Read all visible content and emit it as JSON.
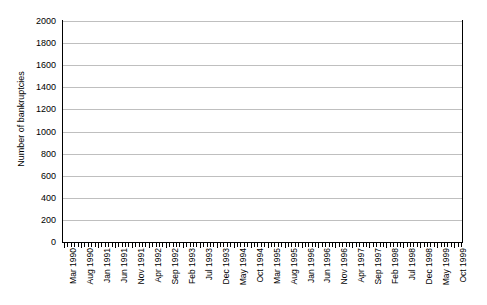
{
  "chart_data": {
    "type": "line",
    "title": "",
    "xlabel": "",
    "ylabel": "Number of bankruptcies",
    "ylim": [
      0,
      2000
    ],
    "ytick_step": 200,
    "yticks": [
      2000,
      1800,
      1600,
      1400,
      1200,
      1000,
      800,
      600,
      400,
      200,
      0
    ],
    "grid": "horizontal",
    "legend": "none",
    "marker": "filled-diamond",
    "line_color": "#000000",
    "grid_color": "#bfbfbf",
    "x_tick_interval_months": 1,
    "x_label_interval_months": 5,
    "x_start": "Mar 1990",
    "x_end": "Dec 1999",
    "xtick_labels": [
      "Mar 1990",
      "Aug 1990",
      "Jan 1991",
      "Jun 1991",
      "Nov 1991",
      "Apr 1992",
      "Sep 1992",
      "Feb 1993",
      "Jul 1993",
      "Dec 1993",
      "May 1994",
      "Oct 1994",
      "Mar 1995",
      "Aug 1995",
      "Jan 1996",
      "Jun 1996",
      "Nov 1996",
      "Apr 1997",
      "Sep 1997",
      "Feb 1998",
      "Jul 1998",
      "Dec 1998",
      "May 1999",
      "Oct 1999"
    ],
    "x": [
      "Mar 1990",
      "Apr 1990",
      "May 1990",
      "Jun 1990",
      "Jul 1990",
      "Aug 1990",
      "Sep 1990",
      "Oct 1990",
      "Nov 1990",
      "Dec 1990",
      "Jan 1991",
      "Feb 1991",
      "Mar 1991",
      "Apr 1991",
      "May 1991",
      "Jun 1991",
      "Jul 1991",
      "Aug 1991",
      "Sep 1991",
      "Oct 1991",
      "Nov 1991",
      "Dec 1991",
      "Jan 1992",
      "Feb 1992",
      "Mar 1992",
      "Apr 1992",
      "May 1992",
      "Jun 1992",
      "Jul 1992",
      "Aug 1992",
      "Sep 1992",
      "Oct 1992",
      "Nov 1992",
      "Dec 1992",
      "Jan 1993",
      "Feb 1993",
      "Mar 1993",
      "Apr 1993",
      "May 1993",
      "Jun 1993",
      "Jul 1993",
      "Aug 1993",
      "Sep 1993",
      "Oct 1993",
      "Nov 1993",
      "Dec 1993",
      "Jan 1994",
      "Feb 1994",
      "Mar 1994",
      "Apr 1994",
      "May 1994",
      "Jun 1994",
      "Jul 1994",
      "Aug 1994",
      "Sep 1994",
      "Oct 1994",
      "Nov 1994",
      "Dec 1994",
      "Jan 1995",
      "Feb 1995",
      "Mar 1995",
      "Apr 1995",
      "May 1995",
      "Jun 1995",
      "Jul 1995",
      "Aug 1995",
      "Sep 1995",
      "Oct 1995",
      "Nov 1995",
      "Dec 1995",
      "Jan 1996",
      "Feb 1996",
      "Mar 1996",
      "Apr 1996",
      "May 1996",
      "Jun 1996",
      "Jul 1996",
      "Aug 1996",
      "Sep 1996",
      "Oct 1996",
      "Nov 1996",
      "Dec 1996",
      "Jan 1997",
      "Feb 1997",
      "Mar 1997",
      "Apr 1997",
      "May 1997",
      "Jun 1997",
      "Jul 1997",
      "Aug 1997",
      "Sep 1997",
      "Oct 1997",
      "Nov 1997",
      "Dec 1997",
      "Jan 1998",
      "Feb 1998",
      "Mar 1998",
      "Apr 1998",
      "May 1998",
      "Jun 1998",
      "Jul 1998",
      "Aug 1998",
      "Sep 1998",
      "Oct 1998",
      "Nov 1998",
      "Dec 1998",
      "Jan 1999",
      "Feb 1999",
      "Mar 1999",
      "Apr 1999",
      "May 1999",
      "Jun 1999",
      "Jul 1999",
      "Aug 1999",
      "Sep 1999",
      "Oct 1999",
      "Nov 1999",
      "Dec 1999"
    ],
    "values": [
      510,
      525,
      530,
      505,
      545,
      540,
      520,
      500,
      510,
      485,
      490,
      530,
      545,
      560,
      600,
      640,
      690,
      620,
      660,
      700,
      650,
      770,
      830,
      860,
      880,
      890,
      885,
      890,
      880,
      900,
      880,
      990,
      1010,
      1040,
      1030,
      1060,
      1050,
      1080,
      1060,
      1005,
      1090,
      1280,
      1180,
      1080,
      1000,
      1350,
      1100,
      1060,
      1150,
      1180,
      1150,
      1120,
      1150,
      1290,
      1300,
      1180,
      1110,
      1060,
      1130,
      1180,
      1150,
      1200,
      1230,
      1290,
      1300,
      1110,
      1180,
      1290,
      1200,
      1150,
      1180,
      1130,
      1290,
      1170,
      1050,
      1200,
      1290,
      1260,
      1190,
      1230,
      1320,
      1250,
      1300,
      1240,
      1340,
      1330,
      1290,
      1290,
      1370,
      1290,
      1600,
      1480,
      1500,
      1400,
      1700,
      1660,
      1770,
      1820,
      1810,
      1700,
      1620,
      1720,
      1480,
      1320,
      1260,
      1080,
      1000,
      930,
      1130,
      1230,
      1180,
      1280,
      1250,
      1330,
      1300,
      1500,
      1380,
      1410
    ]
  },
  "axis": {
    "y_title": "Number of bankruptcies"
  }
}
